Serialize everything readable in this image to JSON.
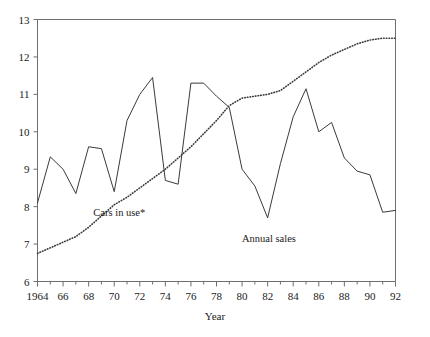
{
  "chart_data": {
    "type": "line",
    "title": "",
    "subtitle": "",
    "xlabel": "Year",
    "ylabel": "",
    "xlim": [
      1964,
      1992
    ],
    "ylim": [
      6,
      13
    ],
    "grid": false,
    "legend_position": "inline-annotations",
    "y_ticks": [
      6,
      7,
      8,
      9,
      10,
      11,
      12,
      13
    ],
    "y_tick_labels": [
      "6",
      "7",
      "8",
      "9",
      "10",
      "11",
      "12",
      "13"
    ],
    "x_ticks": [
      1964,
      1966,
      1968,
      1970,
      1972,
      1974,
      1976,
      1978,
      1980,
      1982,
      1984,
      1986,
      1988,
      1990,
      1992
    ],
    "x_tick_labels": [
      "1964",
      "66",
      "68",
      "70",
      "72",
      "74",
      "76",
      "78",
      "80",
      "82",
      "84",
      "86",
      "88",
      "90",
      "92"
    ],
    "x_minor_ticks": [
      1965,
      1967,
      1969,
      1971,
      1973,
      1975,
      1977,
      1979,
      1981,
      1983,
      1985,
      1987,
      1989,
      1991
    ],
    "x": [
      1964,
      1965,
      1966,
      1967,
      1968,
      1969,
      1970,
      1971,
      1972,
      1973,
      1974,
      1975,
      1976,
      1977,
      1978,
      1979,
      1980,
      1981,
      1982,
      1983,
      1984,
      1985,
      1986,
      1987,
      1988,
      1989,
      1990,
      1991,
      1992
    ],
    "series": [
      {
        "name": "Annual sales",
        "style": "solid",
        "color": "#3a3a3a",
        "label_x": 1982.1,
        "label_y": 7.05,
        "values": [
          8.1,
          9.33,
          9.0,
          8.35,
          9.6,
          9.55,
          8.4,
          10.3,
          11.0,
          11.45,
          8.7,
          8.6,
          11.3,
          11.3,
          10.95,
          10.65,
          9.0,
          8.55,
          7.7,
          9.15,
          10.4,
          11.15,
          10.0,
          10.25,
          9.3,
          8.95,
          8.85,
          7.85,
          7.9
        ]
      },
      {
        "name": "Cars in use*",
        "style": "dotted",
        "color": "#3a3a3a",
        "label_x": 1970.4,
        "label_y": 7.75,
        "values": [
          6.75,
          6.9,
          7.05,
          7.2,
          7.45,
          7.75,
          8.05,
          8.25,
          8.5,
          8.75,
          9.0,
          9.3,
          9.6,
          9.95,
          10.3,
          10.7,
          10.9,
          10.95,
          11.0,
          11.1,
          11.35,
          11.6,
          11.85,
          12.05,
          12.2,
          12.35,
          12.45,
          12.5,
          12.5
        ]
      }
    ]
  }
}
